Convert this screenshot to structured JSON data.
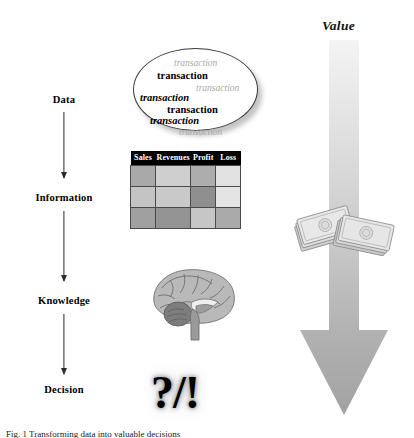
{
  "figure": {
    "background": "#ffffff",
    "caption": "Fig. 1 Transforming data into valuable decisions"
  },
  "stages": {
    "data": "Data",
    "information": "Information",
    "knowledge": "Knowledge",
    "decision": "Decision"
  },
  "flow_arrows": [
    {
      "name": "data-to-information",
      "color": "#2b2b2b"
    },
    {
      "name": "information-to-knowledge",
      "color": "#2b2b2b"
    },
    {
      "name": "knowledge-to-decision",
      "color": "#2b2b2b"
    }
  ],
  "transaction_cloud": {
    "shape": "ellipse",
    "fill": "#ffffff",
    "stroke": "#3a3a3a",
    "items": [
      {
        "text": "transaction",
        "style": "faint"
      },
      {
        "text": "transaction",
        "style": "solid"
      },
      {
        "text": "transaction",
        "style": "faint"
      },
      {
        "text": "transaction",
        "style": "solid"
      },
      {
        "text": "transaction",
        "style": "solid"
      },
      {
        "text": "transaction",
        "style": "solid"
      },
      {
        "text": "transaction",
        "style": "faint"
      }
    ]
  },
  "table": {
    "header_background": "#000000",
    "header_color": "#ffffff",
    "columns": [
      "Sales",
      "Revenues",
      "Profit",
      "Loss"
    ],
    "rows": [
      [
        "#a8a8a8",
        "#cfcfcf",
        "#adadad",
        "#e2e2e2"
      ],
      [
        "#c4c4c4",
        "#c9c9c9",
        "#8f8f8f",
        "#e4e4e4"
      ],
      [
        "#a0a0a0",
        "#949494",
        "#c6c6c6",
        "#aaaaaa"
      ]
    ]
  },
  "brain": {
    "name": "brain-illustration",
    "description": "grayscale sagittal brain"
  },
  "decision_glyph": {
    "text": "?/!"
  },
  "value": {
    "label": "Value",
    "arrow_top_color": "#efefef",
    "arrow_bottom_color": "#a6a6a6"
  },
  "money": {
    "name": "banknote-stack-illustration",
    "description": "grayscale stacks of banknotes"
  }
}
